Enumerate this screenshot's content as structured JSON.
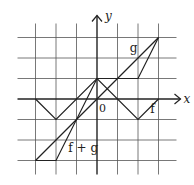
{
  "diagram": {
    "type": "function-graph",
    "origin_px": [
      97,
      99
    ],
    "unit_px": 20.5,
    "grid": {
      "x_min": -3,
      "x_max": 3,
      "y_min": -3,
      "y_max": 3
    },
    "axes": {
      "x_label": "x",
      "y_label": "y",
      "origin_label": "0"
    },
    "curves": [
      {
        "name": "f",
        "label": "f",
        "points": [
          [
            -3,
            0
          ],
          [
            -2,
            -1
          ],
          [
            0,
            1
          ],
          [
            2,
            -1
          ],
          [
            3,
            0
          ]
        ],
        "label_pos": [
          2.6,
          -0.7
        ]
      },
      {
        "name": "g",
        "label": "g",
        "points": [
          [
            -3,
            -3
          ],
          [
            3,
            3
          ]
        ],
        "label_pos": [
          1.6,
          2.3
        ]
      },
      {
        "name": "f_plus_g",
        "label": "f + g",
        "points": [
          [
            -3,
            -3
          ],
          [
            -2,
            -3
          ],
          [
            0,
            1
          ],
          [
            2,
            1
          ],
          [
            3,
            3
          ]
        ],
        "label_pos": [
          -1.4,
          -2.6
        ]
      }
    ],
    "colors": {
      "line": "#222222",
      "grid": "#555555",
      "background": "#ffffff"
    }
  }
}
